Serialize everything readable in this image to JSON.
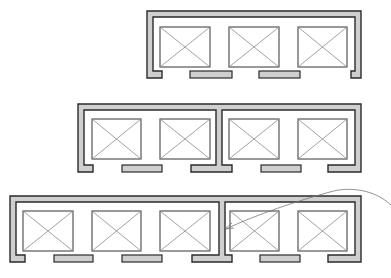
{
  "diagram": {
    "title": "",
    "colors": {
      "wall_fill": "#cfcfcf",
      "wall_stroke": "#2a2a2a",
      "cab_stroke": "#555555",
      "cross_stroke": "#8a8a8a",
      "leader": "#777777"
    },
    "banks": [
      {
        "name": "three-car-bank",
        "groups": [
          3
        ]
      },
      {
        "name": "two-plus-two-car-bank",
        "groups": [
          2,
          2
        ]
      },
      {
        "name": "three-plus-two-car-bank",
        "groups": [
          3,
          2
        ]
      }
    ],
    "annotation": {
      "type": "leader-arrow",
      "label": ""
    }
  }
}
